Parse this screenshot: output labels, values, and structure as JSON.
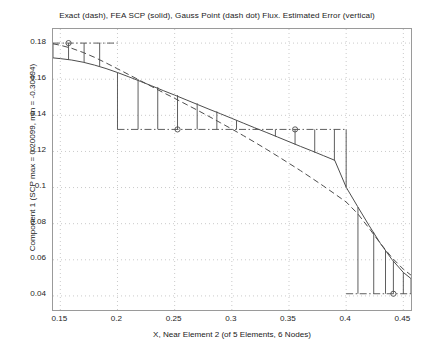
{
  "chart_data": {
    "type": "line",
    "title": "Exact (dash), FEA SCP (solid), Gauss Point (dash dot) Flux. Estimated Error (vertical)",
    "xlabel": "X, Near Element 2 (of 5 Elements, 6 Nodes)",
    "ylabel": "Component 1 (SCP max = 0.20099, min = -0.30494)",
    "xlim": [
      0.1436,
      0.4567
    ],
    "ylim": [
      0.0322,
      0.1878
    ],
    "xticks": [
      0.15,
      0.2,
      0.25,
      0.3,
      0.35,
      0.4,
      0.45
    ],
    "xtick_labels": [
      "0.15",
      "0.2",
      "0.25",
      "0.3",
      "0.35",
      "0.4",
      "0.45"
    ],
    "yticks": [
      0.04,
      0.06,
      0.08,
      0.1,
      0.12,
      0.14,
      0.16,
      0.18
    ],
    "ytick_labels": [
      "0.04",
      "0.06",
      "0.08",
      "0.1",
      "0.12",
      "0.14",
      "0.16",
      "0.18"
    ],
    "grid": true,
    "legend_position": "none",
    "series": [
      {
        "name": "FEA SCP Flux",
        "style": "solid",
        "color": "#4d4d4d",
        "x": [
          0.1436,
          0.15,
          0.16,
          0.17,
          0.18,
          0.19,
          0.2,
          0.21,
          0.22,
          0.23,
          0.24,
          0.25,
          0.26,
          0.27,
          0.28,
          0.29,
          0.3,
          0.31,
          0.32,
          0.33,
          0.34,
          0.35,
          0.36,
          0.37,
          0.38,
          0.39,
          0.4,
          0.41,
          0.42,
          0.43,
          0.44,
          0.45,
          0.4567
        ],
        "y": [
          0.1718,
          0.1714,
          0.1706,
          0.1694,
          0.1678,
          0.1659,
          0.1637,
          0.1613,
          0.1588,
          0.1563,
          0.1537,
          0.1512,
          0.1486,
          0.146,
          0.1434,
          0.1409,
          0.1383,
          0.1357,
          0.1331,
          0.1306,
          0.128,
          0.1254,
          0.1228,
          0.1203,
          0.1177,
          0.1151,
          0.1002,
          0.0895,
          0.079,
          0.069,
          0.0602,
          0.053,
          0.0496
        ]
      },
      {
        "name": "Exact Flux",
        "style": "dashed",
        "color": "#4d4d4d",
        "x": [
          0.1436,
          0.15,
          0.16,
          0.17,
          0.18,
          0.19,
          0.2,
          0.21,
          0.22,
          0.23,
          0.24,
          0.25,
          0.26,
          0.27,
          0.28,
          0.29,
          0.3,
          0.31,
          0.32,
          0.33,
          0.34,
          0.35,
          0.36,
          0.37,
          0.38,
          0.39,
          0.4,
          0.41,
          0.42,
          0.43,
          0.44,
          0.45,
          0.4567
        ],
        "y": [
          0.1796,
          0.1788,
          0.1771,
          0.1748,
          0.1721,
          0.169,
          0.1658,
          0.1625,
          0.1592,
          0.1559,
          0.1526,
          0.1494,
          0.1461,
          0.1428,
          0.1394,
          0.1359,
          0.1324,
          0.1288,
          0.1251,
          0.1213,
          0.1174,
          0.1134,
          0.1094,
          0.1052,
          0.1009,
          0.0965,
          0.092,
          0.0856,
          0.0775,
          0.069,
          0.0612,
          0.0548,
          0.0515
        ]
      },
      {
        "name": "Gauss Point Flux",
        "style": "dashdot",
        "color": "#4d4d4d",
        "segments": [
          {
            "x0": 0.1436,
            "x1": 0.2,
            "y": 0.18
          },
          {
            "x0": 0.2,
            "x1": 0.4,
            "y": 0.1322
          },
          {
            "x0": 0.4,
            "x1": 0.4567,
            "y": 0.0412
          }
        ],
        "markers": [
          {
            "x": 0.1572,
            "y": 0.18
          },
          {
            "x": 0.2525,
            "y": 0.1322
          },
          {
            "x": 0.3553,
            "y": 0.1322
          },
          {
            "x": 0.4413,
            "y": 0.0412
          }
        ]
      },
      {
        "name": "Estimated Error Bars",
        "style": "vertical-solid",
        "color": "#4d4d4d",
        "bars": [
          {
            "x": 0.1436,
            "y0": 0.1718,
            "y1": 0.18
          },
          {
            "x": 0.1572,
            "y0": 0.1707,
            "y1": 0.18
          },
          {
            "x": 0.1708,
            "y0": 0.1692,
            "y1": 0.18
          },
          {
            "x": 0.1844,
            "y0": 0.1671,
            "y1": 0.18
          },
          {
            "x": 0.2,
            "y0": 0.1637,
            "y1": 0.1322
          },
          {
            "x": 0.218,
            "y0": 0.1601,
            "y1": 0.1322
          },
          {
            "x": 0.2352,
            "y0": 0.1557,
            "y1": 0.1322
          },
          {
            "x": 0.2525,
            "y0": 0.1512,
            "y1": 0.1322
          },
          {
            "x": 0.2697,
            "y0": 0.1467,
            "y1": 0.1322
          },
          {
            "x": 0.2869,
            "y0": 0.1422,
            "y1": 0.1322
          },
          {
            "x": 0.3041,
            "y0": 0.1372,
            "y1": 0.1322
          },
          {
            "x": 0.3209,
            "y0": 0.1328,
            "y1": 0.1322
          },
          {
            "x": 0.3381,
            "y0": 0.1283,
            "y1": 0.1322
          },
          {
            "x": 0.3553,
            "y0": 0.1238,
            "y1": 0.1322
          },
          {
            "x": 0.3725,
            "y0": 0.1193,
            "y1": 0.1322
          },
          {
            "x": 0.3897,
            "y0": 0.1148,
            "y1": 0.1322
          },
          {
            "x": 0.4,
            "y0": 0.1002,
            "y1": 0.1322
          },
          {
            "x": 0.4103,
            "y0": 0.0892,
            "y1": 0.0412
          },
          {
            "x": 0.4241,
            "y0": 0.0752,
            "y1": 0.0412
          },
          {
            "x": 0.4344,
            "y0": 0.0655,
            "y1": 0.0412
          },
          {
            "x": 0.4413,
            "y0": 0.0594,
            "y1": 0.0412
          },
          {
            "x": 0.45,
            "y0": 0.053,
            "y1": 0.0412
          },
          {
            "x": 0.4567,
            "y0": 0.0496,
            "y1": 0.0412
          }
        ]
      }
    ]
  }
}
